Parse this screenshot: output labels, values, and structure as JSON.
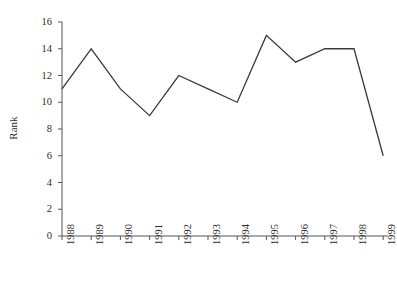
{
  "chart_data": {
    "type": "line",
    "title": "",
    "xlabel": "",
    "ylabel": "Rank",
    "categories": [
      "1988",
      "1989",
      "1990",
      "1991",
      "1992",
      "1993",
      "1994",
      "1995",
      "1996",
      "1997",
      "1998",
      "1999"
    ],
    "values": [
      11,
      14,
      11,
      9,
      12,
      11,
      10,
      15,
      13,
      14,
      14,
      6
    ],
    "series": [
      {
        "name": "Rank",
        "values": [
          11,
          14,
          11,
          9,
          12,
          11,
          10,
          15,
          13,
          14,
          14,
          6
        ]
      }
    ],
    "ylim": [
      0,
      16
    ],
    "y_ticks": [
      "0",
      "2",
      "4",
      "6",
      "8",
      "10",
      "12",
      "14",
      "16"
    ],
    "grid": false,
    "legend": "none",
    "line_color": "#3a3a3a",
    "background_color": "#ffffff",
    "axis_color": "#555555"
  }
}
